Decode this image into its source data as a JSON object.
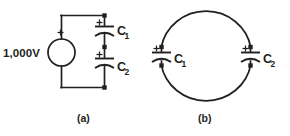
{
  "figure": {
    "kind": "circuit-diagram",
    "background_color": "#ffffff",
    "ink_color": "#231f20",
    "panels": [
      {
        "id": "a",
        "caption": "(a)",
        "topology": "series capacitors across a voltage source",
        "source": {
          "label": "1,000V",
          "polarity_marker": "+",
          "symbol": "circle-source"
        },
        "components": [
          {
            "ref": "C",
            "subscript": "1",
            "type": "polarized-capacitor",
            "polarity_marker": "+"
          },
          {
            "ref": "C",
            "subscript": "2",
            "type": "polarized-capacitor",
            "polarity_marker": "+"
          }
        ]
      },
      {
        "id": "b",
        "caption": "(b)",
        "topology": "series capacitors in a closed loop",
        "components": [
          {
            "ref": "C",
            "subscript": "1",
            "type": "polarized-capacitor",
            "polarity_marker": "+"
          },
          {
            "ref": "C",
            "subscript": "2",
            "type": "polarized-capacitor",
            "polarity_marker": "+"
          }
        ]
      }
    ]
  }
}
